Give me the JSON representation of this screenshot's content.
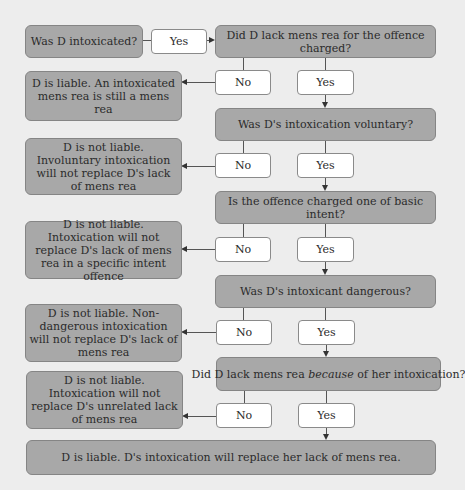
{
  "start": {
    "question": "Was D intoxicated?",
    "yes_label": "Yes"
  },
  "questions": [
    "Did D lack mens rea for the offence charged?",
    "Was D's intoxication voluntary?",
    "Is the offence charged one of basic intent?",
    "Was D's intoxicant dangerous?",
    {
      "before": "Did D lack mens rea ",
      "italic": "because",
      "after": " of her intoxication?"
    }
  ],
  "branch_labels": {
    "no": "No",
    "yes": "Yes"
  },
  "outcomes": [
    "D is liable. An intoxicated mens rea is still a mens rea",
    "D is not liable. Involuntary intoxication will not replace D's lack of mens rea",
    "D is not liable. Intoxication will not replace D's lack of mens rea in a specific intent offence",
    "D is not liable. Non-dangerous intoxication will not replace D's lack of mens rea",
    "D is not liable. Intoxication will not replace D's unrelated lack of mens rea"
  ],
  "final": "D is liable. D's intoxication will replace her lack of mens rea.",
  "colors": {
    "background": "#ededed",
    "box_grey": "#a8a8a8",
    "box_white": "#ffffff",
    "line": "#555555"
  }
}
